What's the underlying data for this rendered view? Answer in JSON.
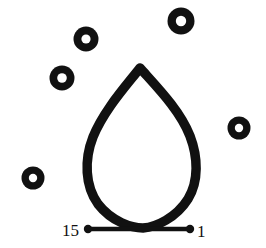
{
  "figure": {
    "background_color": "#ffffff",
    "ink_color": "#111111",
    "width": 266,
    "height": 248,
    "stroke_width": 9.5
  },
  "petal": {
    "name": "petal-outline",
    "apex": {
      "x": 140,
      "y": 68
    },
    "base_vertex": {
      "x": 143,
      "y": 228
    },
    "left_extent_x": 87,
    "right_extent_x": 196,
    "widest_y": 166,
    "path": "M140,68 C126,86 104,110 93,137 C84,160 85,186 98,204 C112,222 132,228 143,228 C156,227 176,218 188,199 C199,181 198,157 190,136 C180,110 156,86 140,68 Z"
  },
  "baseline": {
    "name": "baseline-segment",
    "start": {
      "x": 88,
      "y": 229
    },
    "end": {
      "x": 190,
      "y": 229
    },
    "dot_radius": 4.2
  },
  "vertex_labels": [
    {
      "id": "label-15",
      "text": "15",
      "x": 62,
      "y": 236,
      "anchor": "start"
    },
    {
      "id": "label-1",
      "text": "1",
      "x": 197,
      "y": 237,
      "anchor": "start"
    }
  ],
  "rings": [
    {
      "id": "ring-top-left",
      "cx": 86,
      "cy": 39,
      "r_outer": 12.5,
      "r_inner": 4.6
    },
    {
      "id": "ring-top-right",
      "cx": 181,
      "cy": 21,
      "r_outer": 13.5,
      "r_inner": 5.2
    },
    {
      "id": "ring-left-middle",
      "cx": 62,
      "cy": 78,
      "r_outer": 12.5,
      "r_inner": 4.8
    },
    {
      "id": "ring-right-middle",
      "cx": 239,
      "cy": 128,
      "r_outer": 11.5,
      "r_inner": 4.2
    },
    {
      "id": "ring-bottom-left",
      "cx": 33,
      "cy": 178,
      "r_outer": 11.5,
      "r_inner": 4.2
    }
  ]
}
